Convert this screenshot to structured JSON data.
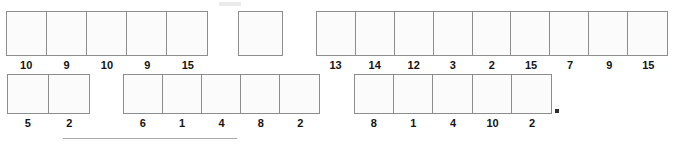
{
  "page": {
    "background_color": "#ffffff",
    "cell_border_color": "#8d8d8d",
    "cell_fill_color": "#fbfbfb",
    "label_color": "#141414"
  },
  "strips": [
    {
      "id": "top-left-strip",
      "row": "top",
      "cell_count": 5,
      "labels": [
        "10",
        "9",
        "10",
        "9",
        "15"
      ]
    },
    {
      "id": "top-right-strip",
      "row": "top",
      "cell_count": 9,
      "labels": [
        "13",
        "14",
        "12",
        "3",
        "2",
        "15",
        "7",
        "9",
        "15"
      ]
    },
    {
      "id": "bottom-left-strip",
      "row": "bottom",
      "cell_count": 2,
      "labels": [
        "5",
        "2"
      ]
    },
    {
      "id": "bottom-middle-strip",
      "row": "bottom",
      "cell_count": 5,
      "labels": [
        "6",
        "1",
        "4",
        "8",
        "2"
      ]
    },
    {
      "id": "bottom-right-strip",
      "row": "bottom",
      "cell_count": 5,
      "labels": [
        "8",
        "1",
        "4",
        "10",
        "2"
      ]
    }
  ],
  "solo_cell": {
    "id": "top-solo-cell",
    "label": ""
  },
  "marks": {
    "ink_dot": "period-mark",
    "scan_rule": "horizontal-rule",
    "scan_smudge": "scan-artifact"
  }
}
